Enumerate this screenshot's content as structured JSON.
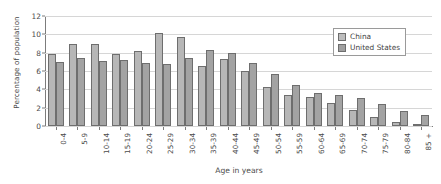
{
  "chart_data": {
    "type": "bar",
    "title": "",
    "xlabel": "Age in years",
    "ylabel": "Percentage of population",
    "ylim": [
      0,
      12
    ],
    "yticks": [
      0,
      2,
      4,
      6,
      8,
      10,
      12
    ],
    "grid": true,
    "legend_position": "top-right",
    "categories": [
      "0-4",
      "5-9",
      "10-14",
      "15-19",
      "20-24",
      "25-29",
      "30-34",
      "35-39",
      "40-44",
      "45-49",
      "50-54",
      "55-59",
      "60-64",
      "65-69",
      "70-74",
      "75-79",
      "80-84",
      "85 +"
    ],
    "series": [
      {
        "name": "China",
        "color": "#b7b7b7",
        "values": [
          7.9,
          9.0,
          8.95,
          7.9,
          8.2,
          10.2,
          9.75,
          6.6,
          7.3,
          5.95,
          4.25,
          3.4,
          3.15,
          2.5,
          1.8,
          1.0,
          0.4,
          0.15
        ]
      },
      {
        "name": "United States",
        "color": "#a3a3a3",
        "values": [
          7.0,
          7.4,
          7.05,
          7.15,
          6.9,
          6.8,
          7.4,
          8.3,
          8.0,
          6.85,
          5.7,
          4.45,
          3.65,
          3.35,
          3.05,
          2.4,
          1.6,
          1.2
        ]
      }
    ]
  },
  "axes": {
    "y_title": "Percentage of population",
    "x_title": "Age in years"
  },
  "legend": {
    "entries": [
      {
        "label": "China",
        "swatch": "china"
      },
      {
        "label": "United States",
        "swatch": "us"
      }
    ]
  }
}
